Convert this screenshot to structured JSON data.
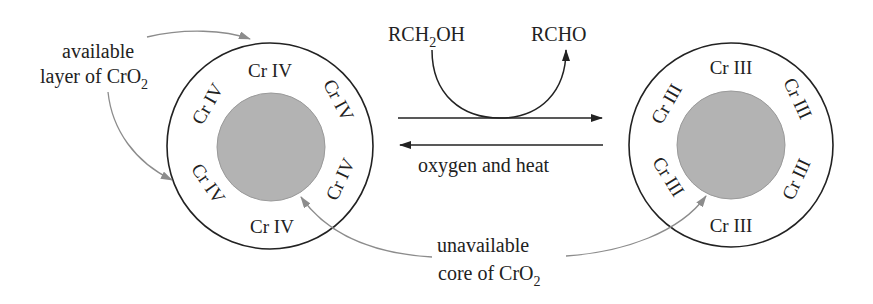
{
  "diagram": {
    "colors": {
      "stroke": "#222222",
      "core_fill": "#b3b3b3",
      "annotation": "#8c8c8c",
      "background": "#ffffff"
    },
    "left_particle": {
      "layer_labels": [
        "Cr IV",
        "Cr IV",
        "Cr IV",
        "Cr IV",
        "Cr IV",
        "Cr IV"
      ]
    },
    "right_particle": {
      "layer_labels": [
        "Cr III",
        "Cr III",
        "Cr III",
        "Cr III",
        "Cr III",
        "Cr III"
      ]
    },
    "reaction": {
      "reactant_main": "RCH",
      "reactant_sub": "2",
      "reactant_tail": "OH",
      "product": "RCHO",
      "reverse_condition": "oxygen and heat"
    },
    "annotations": {
      "available_line1": "available",
      "available_line2_main": "layer of CrO",
      "available_line2_sub": "2",
      "unavailable_line1": "unavailable",
      "unavailable_line2_main": "core of CrO",
      "unavailable_line2_sub": "2"
    }
  }
}
